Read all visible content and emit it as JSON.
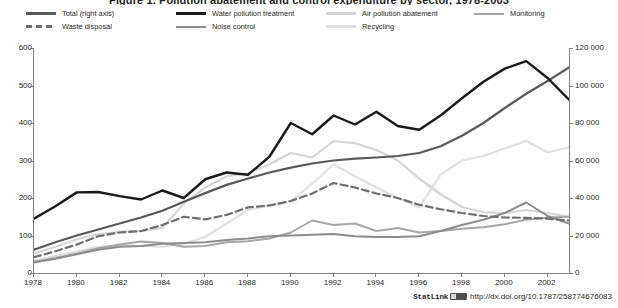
{
  "title": "Figure 1. Pollution abatement and control expenditure by sector, 1978-2003",
  "legend": {
    "position": "top",
    "items": [
      {
        "label": "Total (right axis)",
        "color": "#595959",
        "width": 2.2,
        "dash": "none",
        "key": "total"
      },
      {
        "label": "Waste disposal",
        "color": "#6e6e6e",
        "width": 2.2,
        "dash": "dashed",
        "key": "waste_disposal"
      },
      {
        "label": "Water pollution treatment",
        "color": "#1a1a1a",
        "width": 2.4,
        "dash": "none",
        "key": "water_pollution_treatment"
      },
      {
        "label": "Noise control",
        "color": "#8c8c8c",
        "width": 2.0,
        "dash": "none",
        "key": "noise_control"
      },
      {
        "label": "Air pollution abatement",
        "color": "#d4d4d4",
        "width": 2.2,
        "dash": "none",
        "key": "air_pollution_abatement"
      },
      {
        "label": "Recycling",
        "color": "#e0e0e0",
        "width": 2.2,
        "dash": "none",
        "key": "recycling"
      },
      {
        "label": "Monitoring",
        "color": "#a6a6a6",
        "width": 2.0,
        "dash": "none",
        "key": "monitoring"
      }
    ]
  },
  "statlink": {
    "word": "StatLink",
    "url": "http://dx.doi.org/10.1787/258774676083"
  },
  "chart_data": {
    "type": "line",
    "title": "Figure 1. Pollution abatement and control expenditure by sector, 1978-2003",
    "xlabel": "",
    "ylabel": "",
    "ylabel_right": "",
    "grid": false,
    "legend_position": "top",
    "x": [
      1978,
      1979,
      1980,
      1981,
      1982,
      1983,
      1984,
      1985,
      1986,
      1987,
      1988,
      1989,
      1990,
      1991,
      1992,
      1993,
      1994,
      1995,
      1996,
      1997,
      1998,
      1999,
      2000,
      2001,
      2002,
      2003
    ],
    "xlim": [
      1978,
      2003
    ],
    "xticks": [
      1978,
      1980,
      1982,
      1984,
      1986,
      1988,
      1990,
      1992,
      1994,
      1996,
      1998,
      2000,
      2002
    ],
    "ylim_left": [
      0,
      600
    ],
    "yticks_left": [
      0,
      100,
      200,
      300,
      400,
      500,
      600
    ],
    "ylim_right": [
      0,
      120000
    ],
    "yticks_right": [
      "0",
      "20 000",
      "40 000",
      "60 000",
      "80 000",
      "100 000",
      "120 000"
    ],
    "yticklabels_left": [
      "0",
      "100",
      "200",
      "300",
      "400",
      "500",
      "600"
    ],
    "series": [
      {
        "name": "Total (right axis)",
        "axis": "right",
        "color": "#595959",
        "dash": "none",
        "width": 2.2,
        "values_left_scale": [
          62,
          82,
          100,
          116,
          132,
          148,
          166,
          190,
          213,
          235,
          252,
          268,
          281,
          292,
          300,
          305,
          308,
          312,
          320,
          338,
          366,
          400,
          440,
          478,
          512,
          548
        ]
      },
      {
        "name": "Water pollution treatment",
        "axis": "left",
        "color": "#1a1a1a",
        "dash": "none",
        "width": 2.4,
        "values": [
          145,
          178,
          215,
          216,
          205,
          196,
          220,
          200,
          250,
          268,
          262,
          310,
          400,
          370,
          420,
          396,
          430,
          392,
          382,
          420,
          466,
          510,
          545,
          565,
          520,
          462
        ]
      },
      {
        "name": "Waste disposal",
        "axis": "left",
        "color": "#6e6e6e",
        "dash": "dashed",
        "width": 2.2,
        "values": [
          42,
          58,
          76,
          98,
          108,
          112,
          128,
          150,
          143,
          155,
          175,
          180,
          192,
          212,
          240,
          228,
          212,
          200,
          182,
          170,
          160,
          152,
          148,
          147,
          145,
          140
        ]
      },
      {
        "name": "Noise control",
        "axis": "left",
        "color": "#8c8c8c",
        "dash": "none",
        "width": 2.0,
        "values": [
          28,
          38,
          50,
          62,
          70,
          72,
          78,
          80,
          82,
          88,
          92,
          98,
          100,
          102,
          104,
          98,
          96,
          96,
          98,
          112,
          128,
          142,
          160,
          188,
          152,
          132
        ]
      },
      {
        "name": "Air pollution abatement",
        "axis": "left",
        "color": "#d4d4d4",
        "dash": "none",
        "width": 2.2,
        "values": [
          52,
          70,
          90,
          104,
          110,
          112,
          120,
          185,
          228,
          258,
          266,
          290,
          320,
          308,
          352,
          346,
          328,
          300,
          252,
          210,
          176,
          162,
          160,
          168,
          160,
          150
        ]
      },
      {
        "name": "Recycling",
        "axis": "left",
        "color": "#e0e0e0",
        "dash": "none",
        "width": 2.2,
        "values": [
          33,
          45,
          58,
          70,
          74,
          72,
          70,
          78,
          96,
          132,
          168,
          180,
          192,
          238,
          290,
          258,
          228,
          200,
          175,
          262,
          300,
          312,
          332,
          352,
          322,
          335
        ]
      },
      {
        "name": "Monitoring",
        "axis": "left",
        "color": "#a6a6a6",
        "dash": "none",
        "width": 2.0,
        "values": [
          30,
          40,
          52,
          66,
          76,
          84,
          80,
          70,
          72,
          82,
          85,
          92,
          108,
          140,
          128,
          132,
          112,
          120,
          108,
          112,
          118,
          122,
          130,
          142,
          148,
          150
        ]
      }
    ]
  }
}
